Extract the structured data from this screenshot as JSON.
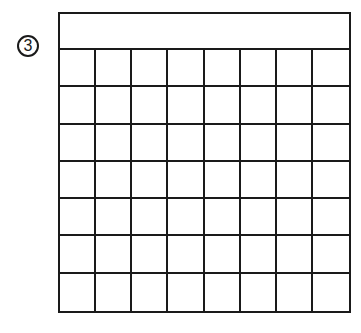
{
  "marker": {
    "label": "3",
    "icon": "circled-number"
  },
  "grid": {
    "columns": 8,
    "rows": 7,
    "header_row": true,
    "line_color": "#1a1a1a"
  }
}
